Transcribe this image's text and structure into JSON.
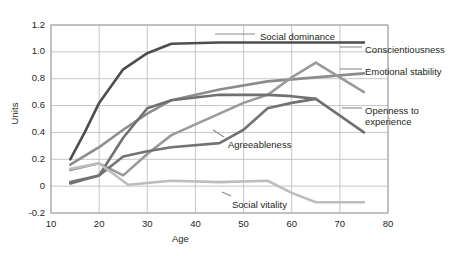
{
  "chart_data": {
    "type": "line",
    "title": "",
    "xlabel": "Age",
    "ylabel": "Units",
    "xlim": [
      10,
      80
    ],
    "ylim": [
      -0.2,
      1.2
    ],
    "x_ticks": [
      10,
      20,
      30,
      40,
      50,
      60,
      70,
      80
    ],
    "y_ticks": [
      -0.2,
      0,
      0.2,
      0.4,
      0.6,
      0.8,
      1.0,
      1.2
    ],
    "x_tick_labels": [
      "10",
      "20",
      "30",
      "40",
      "50",
      "60",
      "70",
      "80"
    ],
    "y_tick_labels": [
      "-0.2",
      "0",
      "0.2",
      "0.4",
      "0.6",
      "0.8",
      "1.0",
      "1.2"
    ],
    "grid": true,
    "legend": "inline-annotations",
    "series": [
      {
        "name": "Social dominance",
        "color": "#4d4d4d",
        "label_x": 260,
        "label_y": 31,
        "x": [
          14,
          17,
          20,
          25,
          30,
          35,
          45,
          55,
          65,
          75
        ],
        "y": [
          0.2,
          0.4,
          0.62,
          0.87,
          0.99,
          1.06,
          1.07,
          1.07,
          1.07,
          1.07
        ]
      },
      {
        "name": "Conscientiousness",
        "color": "#8c8c8c",
        "label_x": 365,
        "label_y": 44,
        "x": [
          14,
          20,
          25,
          30,
          35,
          45,
          55,
          65,
          75
        ],
        "y": [
          0.16,
          0.29,
          0.42,
          0.54,
          0.64,
          0.72,
          0.78,
          0.81,
          0.84
        ]
      },
      {
        "name": "Emotional stability",
        "color": "#9a9a9a",
        "label_x": 365,
        "label_y": 66,
        "x": [
          14,
          20,
          25,
          30,
          35,
          45,
          50,
          55,
          60,
          65,
          75
        ],
        "y": [
          0.12,
          0.17,
          0.08,
          0.24,
          0.38,
          0.54,
          0.62,
          0.68,
          0.81,
          0.92,
          0.7
        ]
      },
      {
        "name": "Openness to experience",
        "color": "#707070",
        "label_x": 365,
        "label_y": 105,
        "x": [
          14,
          20,
          25,
          30,
          35,
          45,
          50,
          55,
          60,
          65,
          75
        ],
        "y": [
          0.02,
          0.08,
          0.36,
          0.58,
          0.64,
          0.68,
          0.68,
          0.68,
          0.67,
          0.65,
          0.4
        ]
      },
      {
        "name": "Agreeableness",
        "color": "#737373",
        "label_x": 228,
        "label_y": 139,
        "x": [
          14,
          20,
          25,
          30,
          35,
          45,
          50,
          55,
          60,
          65
        ],
        "y": [
          0.03,
          0.08,
          0.22,
          0.26,
          0.29,
          0.32,
          0.42,
          0.58,
          0.62,
          0.65
        ]
      },
      {
        "name": "Social vitality",
        "color": "#bdbdbd",
        "label_x": 232,
        "label_y": 199,
        "x": [
          14,
          20,
          26,
          35,
          45,
          55,
          60,
          65,
          75
        ],
        "y": [
          0.13,
          0.17,
          0.01,
          0.04,
          0.03,
          0.04,
          -0.05,
          -0.12,
          -0.12
        ]
      }
    ],
    "annotation_leaders": [
      {
        "name": "social-dominance-leader",
        "x1": 215,
        "y1": 34,
        "x2": 255,
        "y2": 34
      },
      {
        "name": "conscientiousness-leader",
        "x1": 340,
        "y1": 47,
        "x2": 362,
        "y2": 47
      },
      {
        "name": "emotional-stability-leader",
        "x1": 340,
        "y1": 69,
        "x2": 362,
        "y2": 69
      },
      {
        "name": "openness-leader",
        "x1": 342,
        "y1": 108,
        "x2": 362,
        "y2": 108
      },
      {
        "name": "agreeableness-leader",
        "x1": 213,
        "y1": 130,
        "x2": 224,
        "y2": 137
      },
      {
        "name": "social-vitality-leader",
        "x1": 222,
        "y1": 192,
        "x2": 231,
        "y2": 196
      }
    ]
  },
  "plot_geometry": {
    "left": 51,
    "right": 388,
    "top": 25,
    "bottom": 213
  },
  "colors": {
    "background": "#ffffff",
    "axis": "#a6a6a6",
    "grid": "#bfbfbf",
    "text": "#231f20"
  }
}
